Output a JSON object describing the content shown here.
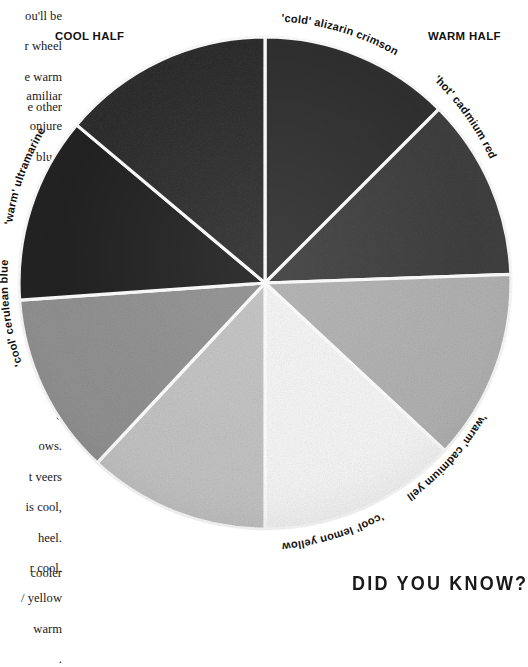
{
  "page": {
    "background": "#ffffff",
    "width": 519,
    "height": 590
  },
  "body_text": {
    "block_1": [
      "ou'll be",
      "r wheel",
      "e warm",
      "e other"
    ],
    "block_2": [
      "amiliar",
      "onjure",
      "blue-",
      "sky"
    ],
    "block_3": [
      "e",
      "ows.",
      "t veers",
      "is cool,",
      "heel.",
      "r cool.",
      "/ yellow",
      "warm",
      "."
    ],
    "block_4": [
      "cooler"
    ]
  },
  "headings": {
    "cool_half": "COOL HALF",
    "warm_half": "WARM HALF"
  },
  "sidebar_heading": {
    "did_you_know": "DID YOU KNOW?"
  },
  "chart_data": {
    "type": "pie",
    "subtitle": "",
    "xlabel": "",
    "ylabel": "",
    "legend_position": "around-perimeter",
    "grid": false,
    "center_x": 265,
    "center_y": 283,
    "radius": 248,
    "note": "Eight equal 45° segments of a painted colour wheel, reproduced in greyscale. Values are equal shares (12.5% each).",
    "categories": [
      "'cold' alizarin crimson",
      "'hot' cadmium red",
      "'warm' cadmium yellow",
      "'cool' lemon yellow",
      "'warm' sap green",
      "'cool' cerulean blue",
      "'warm' ultramarine",
      "'cool' violet"
    ],
    "values": [
      12.5,
      12.5,
      12.5,
      12.5,
      12.5,
      12.5,
      12.5,
      12.5
    ],
    "segments": [
      {
        "label": "'cold' alizarin crimson",
        "label_visible": true,
        "half": "warm",
        "start_angle": 0,
        "end_angle": 45,
        "value": 12.5,
        "color": "#2d2d2d"
      },
      {
        "label": "'hot' cadmium red",
        "label_visible": true,
        "half": "warm",
        "start_angle": 45,
        "end_angle": 88,
        "value": 12.5,
        "color": "#3b3b3b"
      },
      {
        "label": "'warm' cadmium yellow",
        "label_visible": true,
        "half": "warm",
        "start_angle": 88,
        "end_angle": 133,
        "value": 12.5,
        "color": "#b0b0b0"
      },
      {
        "label": "'cool' lemon yellow",
        "label_visible": true,
        "half": "warm",
        "start_angle": 133,
        "end_angle": 180,
        "value": 12.5,
        "color": "#f6f6f6"
      },
      {
        "label": "",
        "label_visible": false,
        "half": "cool",
        "start_angle": 180,
        "end_angle": 223,
        "value": 12.5,
        "color": "#c2c2c2"
      },
      {
        "label": "'cool' cerulean blue",
        "label_visible": true,
        "half": "cool",
        "start_angle": 223,
        "end_angle": 266,
        "value": 12.5,
        "color": "#8f8f8f"
      },
      {
        "label": "'warm' ultramarine",
        "label_visible": true,
        "half": "cool",
        "start_angle": 266,
        "end_angle": 310,
        "value": 12.5,
        "color": "#1f1f1f"
      },
      {
        "label": "",
        "label_visible": false,
        "half": "cool",
        "start_angle": 310,
        "end_angle": 360,
        "value": 12.5,
        "color": "#2a2a2a"
      }
    ],
    "perimeter_labels": [
      "'cold' alizarin crimson",
      "'hot' cadmium red",
      "'warm' cadmium yellow",
      "'cool' lemon yellow",
      "'cool' cerulean blue",
      "'warm' ultramarine"
    ],
    "colors": {
      "divider": "#ffffff",
      "label_text": "#111111",
      "page_background": "#ffffff"
    }
  }
}
